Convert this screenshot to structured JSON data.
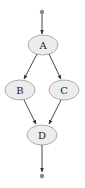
{
  "diagram": {
    "type": "flow-graph",
    "start": {
      "id": "start",
      "shape": "dot"
    },
    "end": {
      "id": "end",
      "shape": "dot"
    },
    "nodes": [
      {
        "id": "A",
        "label": "A"
      },
      {
        "id": "B",
        "label": "B"
      },
      {
        "id": "C",
        "label": "C"
      },
      {
        "id": "D",
        "label": "D"
      }
    ],
    "edges": [
      {
        "from": "start",
        "to": "A"
      },
      {
        "from": "A",
        "to": "B"
      },
      {
        "from": "A",
        "to": "C"
      },
      {
        "from": "B",
        "to": "D"
      },
      {
        "from": "C",
        "to": "D"
      },
      {
        "from": "D",
        "to": "end"
      }
    ],
    "colors": {
      "node_fill": "#ececec",
      "node_stroke": "#9a9a9a",
      "edge": "#333333",
      "terminal": "#8a8a8a"
    }
  }
}
